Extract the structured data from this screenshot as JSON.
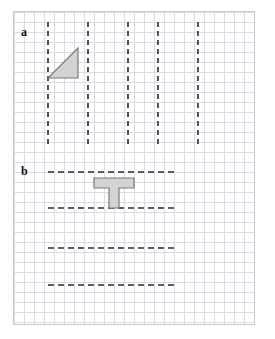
{
  "figure": {
    "top_clipped_text": "· ·        ·",
    "grid": {
      "cell_size_px": 10,
      "frame_left_px": 13,
      "frame_top_px": 11,
      "frame_width_px": 242,
      "frame_height_px": 314,
      "grid_line_color": "#dcdce2",
      "frame_color": "#c9c9cf",
      "background_color": "#ffffff"
    },
    "panels": [
      {
        "id": "a",
        "label": "a",
        "label_x": 21,
        "label_y": 26,
        "line_orientation": "vertical",
        "dashed_line_color": "#2b2b2b",
        "lines": [
          {
            "x": 48,
            "y1": 22,
            "y2": 147
          },
          {
            "x": 88,
            "y1": 22,
            "y2": 147
          },
          {
            "x": 128,
            "y1": 22,
            "y2": 147
          },
          {
            "x": 158,
            "y1": 22,
            "y2": 147
          },
          {
            "x": 198,
            "y1": 22,
            "y2": 147
          }
        ],
        "shape": {
          "name": "right-triangle",
          "fill": "#d3d3d3",
          "stroke": "#7a7a7a",
          "points": "48,78 78,78 78,48"
        }
      },
      {
        "id": "b",
        "label": "b",
        "label_x": 21,
        "label_y": 165,
        "line_orientation": "horizontal",
        "dashed_line_color": "#2b2b2b",
        "lines": [
          {
            "y": 172,
            "x1": 48,
            "x2": 178
          },
          {
            "y": 208,
            "x1": 48,
            "x2": 178
          },
          {
            "y": 248,
            "x1": 48,
            "x2": 178
          },
          {
            "y": 285,
            "x1": 48,
            "x2": 178
          }
        ],
        "shape": {
          "name": "t-shape",
          "fill": "#d3d3d3",
          "stroke": "#7a7a7a",
          "points": "94,178 134,178 134,188 119,188 119,208 109,208 109,188 94,188"
        }
      }
    ]
  }
}
